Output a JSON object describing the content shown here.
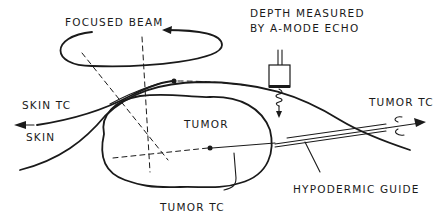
{
  "diagram": {
    "type": "schematic",
    "labels": {
      "focused_beam": "FOCUSED BEAM",
      "depth_line1": "DEPTH MEASURED",
      "depth_line2": "BY A-MODE ECHO",
      "skin_tc": "SKIN TC",
      "skin": "SKIN",
      "tumor": "TUMOR",
      "tumor_tc_right": "TUMOR TC",
      "tumor_tc_bottom": "TUMOR TC",
      "hypodermic_guide": "HYPODERMIC GUIDE"
    },
    "colors": {
      "ink": "#1a1a1a",
      "background": "#ffffff"
    }
  }
}
